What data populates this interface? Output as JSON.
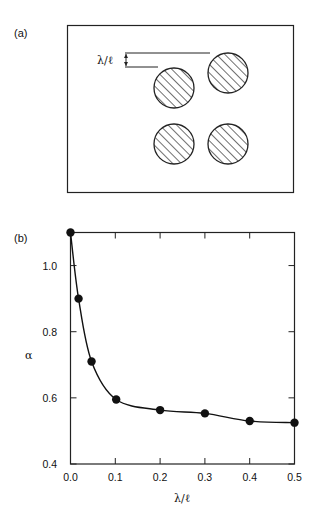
{
  "panel_a": {
    "label": "(a)",
    "annotation": "λ/ℓ",
    "circles": [
      {
        "cx": 174,
        "cy": 88
      },
      {
        "cx": 228,
        "cy": 73
      },
      {
        "cx": 174,
        "cy": 144
      },
      {
        "cx": 228,
        "cy": 144
      }
    ]
  },
  "panel_b": {
    "label": "(b)"
  },
  "chart_data": {
    "type": "line",
    "title": "",
    "xlabel": "λ/ℓ",
    "ylabel": "α",
    "xlim": [
      0.0,
      0.5
    ],
    "ylim": [
      0.4,
      1.1
    ],
    "x_ticks": [
      "0.0",
      "0.1",
      "0.2",
      "0.3",
      "0.4",
      "0.5"
    ],
    "y_ticks": [
      "0.4",
      "0.6",
      "0.8",
      "1.0"
    ],
    "grid": false,
    "legend": null,
    "series": [
      {
        "name": "α vs λ/ℓ",
        "marker": "filled-circle",
        "x": [
          0.0,
          0.018,
          0.047,
          0.102,
          0.2,
          0.3,
          0.4,
          0.5
        ],
        "y": [
          1.1,
          0.9,
          0.71,
          0.595,
          0.563,
          0.553,
          0.53,
          0.525
        ]
      }
    ]
  }
}
